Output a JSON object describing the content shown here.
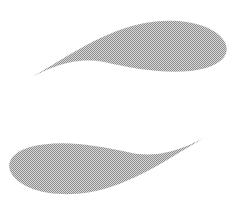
{
  "canvas": {
    "width": 235,
    "height": 212,
    "background_color": "#ffffff",
    "title": "Abstract crescent logo mark"
  },
  "palette": {
    "shape_fill": "#a8a8a8",
    "dither_light": "#d6d6d6",
    "dither_dark": "#8f8f8f",
    "background": "#ffffff"
  },
  "graphic": {
    "type": "vector-logo",
    "description": "Two opposed tapering crescent strokes forming an open ellipse",
    "fill_style": "halftone-dither-gray",
    "shapes": [
      {
        "id": "upper-crescent",
        "name": "upper-crescent",
        "orientation": "sweeps up-right",
        "tip_point": {
          "x": 28,
          "y": 79
        },
        "blunt_end": {
          "x": 225,
          "y": 50
        },
        "apex_y": 21,
        "max_thickness": 45,
        "path": "M 28 79 C 60 62 96 34 140 24 C 178 16 210 24 222 38 C 232 50 226 62 206 68 C 176 76 140 70 104 62 C 72 56 46 70 28 79 Z"
      },
      {
        "id": "lower-crescent",
        "name": "lower-crescent",
        "orientation": "sweeps down-left",
        "tip_point": {
          "x": 208,
          "y": 136
        },
        "blunt_end": {
          "x": 10,
          "y": 165
        },
        "apex_y": 192,
        "max_thickness": 45,
        "path": "M 208 136 C 176 153 140 181 96 191 C 58 199 26 191 14 177 C 4 165 10 153 30 147 C 60 139 96 145 132 153 C 164 159 190 145 208 136 Z"
      }
    ]
  }
}
